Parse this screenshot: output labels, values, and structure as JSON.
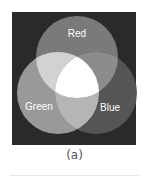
{
  "figure": {
    "caption": "(a)",
    "circles": [
      {
        "label": "Red",
        "cx": 77,
        "cy": 57,
        "r": 41
      },
      {
        "label": "Green",
        "cx": 58,
        "cy": 93,
        "r": 41
      },
      {
        "label": "Blue",
        "cx": 96,
        "cy": 93,
        "r": 41
      }
    ],
    "colors": {
      "background": "#2a2a2a",
      "red": "#7a7a7a",
      "green": "#999999",
      "blue": "#555555",
      "red_green": "#d2d2d2",
      "red_blue": "#8c8c8c",
      "green_blue": "#b5b5b5",
      "all": "#ffffff"
    }
  }
}
